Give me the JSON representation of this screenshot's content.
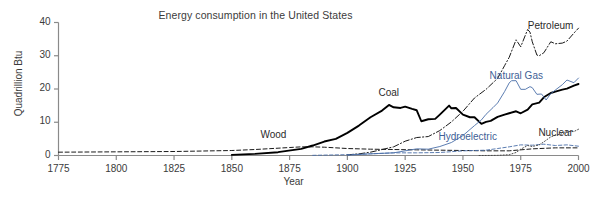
{
  "chart_data": {
    "type": "line",
    "title": "Energy consumption in the United States",
    "xlabel": "Year",
    "ylabel": "Quadrillion Btu",
    "xlim": [
      1775,
      2000
    ],
    "ylim": [
      0,
      40
    ],
    "xticks": [
      "1775",
      "1800",
      "1825",
      "1850",
      "1875",
      "1900",
      "1925",
      "1950",
      "1975",
      "2000"
    ],
    "yticks": [
      "0",
      "10",
      "20",
      "30",
      "40"
    ],
    "grid": false,
    "legend_position": "inline-annotations",
    "series": [
      {
        "name": "Wood",
        "style": "dashed",
        "color": "#1a1a1a",
        "label_x": 1868,
        "label_y": 6.0,
        "x": [
          1775,
          1800,
          1825,
          1850,
          1860,
          1870,
          1875,
          1880,
          1885,
          1890,
          1895,
          1900,
          1910,
          1920,
          1930,
          1940,
          1950,
          1960,
          1970,
          1980,
          1990,
          2000
        ],
        "y": [
          1.0,
          1.1,
          1.2,
          1.5,
          1.8,
          2.2,
          2.4,
          2.6,
          2.6,
          2.5,
          2.3,
          2.1,
          1.9,
          1.8,
          1.7,
          1.6,
          1.5,
          1.4,
          1.4,
          2.0,
          2.3,
          2.3
        ]
      },
      {
        "name": "Coal",
        "style": "solid",
        "color": "#000000",
        "label_x": 1918,
        "label_y": 18.5,
        "x": [
          1850,
          1860,
          1870,
          1880,
          1885,
          1890,
          1895,
          1900,
          1905,
          1910,
          1915,
          1918,
          1920,
          1923,
          1925,
          1928,
          1930,
          1932,
          1935,
          1938,
          1940,
          1944,
          1945,
          1947,
          1950,
          1953,
          1955,
          1958,
          1960,
          1962,
          1965,
          1968,
          1970,
          1973,
          1975,
          1978,
          1980,
          1983,
          1985,
          1988,
          1990,
          1993,
          1995,
          1998,
          2000
        ],
        "y": [
          0.2,
          0.5,
          1.0,
          2.0,
          3.0,
          4.2,
          5.0,
          6.8,
          9.0,
          11.5,
          13.5,
          15.2,
          14.5,
          14.3,
          14.7,
          14.0,
          13.6,
          10.3,
          10.9,
          11.0,
          12.3,
          15.0,
          14.2,
          14.3,
          12.3,
          11.5,
          11.5,
          9.5,
          10.1,
          10.4,
          11.6,
          12.3,
          12.7,
          13.3,
          12.7,
          13.8,
          15.4,
          15.9,
          17.5,
          18.8,
          19.2,
          19.8,
          20.1,
          21.0,
          21.5
        ]
      },
      {
        "name": "Petroleum",
        "style": "dashdot",
        "color": "#1a1a1a",
        "label_x": 1988,
        "label_y": 38.5,
        "x": [
          1900,
          1905,
          1910,
          1915,
          1920,
          1925,
          1930,
          1935,
          1940,
          1945,
          1950,
          1955,
          1960,
          1965,
          1968,
          1970,
          1973,
          1975,
          1978,
          1979,
          1980,
          1982,
          1983,
          1985,
          1988,
          1990,
          1993,
          1995,
          1998,
          2000
        ],
        "y": [
          0.2,
          0.5,
          1.0,
          1.8,
          2.6,
          4.3,
          5.4,
          5.7,
          7.5,
          10.1,
          13.3,
          17.3,
          19.9,
          23.2,
          27.0,
          29.5,
          34.8,
          32.7,
          37.9,
          37.1,
          34.2,
          30.2,
          30.0,
          30.9,
          34.2,
          33.6,
          33.8,
          34.4,
          36.8,
          38.3
        ]
      },
      {
        "name": "Natural Gas",
        "style": "solid-thin",
        "color": "#4a6ea8",
        "label_x": 1973,
        "label_y": 23.5,
        "x": [
          1900,
          1910,
          1920,
          1930,
          1935,
          1940,
          1945,
          1950,
          1955,
          1958,
          1960,
          1963,
          1965,
          1968,
          1970,
          1971,
          1973,
          1975,
          1977,
          1979,
          1980,
          1982,
          1984,
          1986,
          1988,
          1990,
          1993,
          1995,
          1998,
          2000
        ],
        "y": [
          0.1,
          0.5,
          0.8,
          2.0,
          1.9,
          2.7,
          3.9,
          6.0,
          9.0,
          10.7,
          12.4,
          14.4,
          15.8,
          19.2,
          21.8,
          22.5,
          22.5,
          19.9,
          19.9,
          20.7,
          20.4,
          18.4,
          18.5,
          16.7,
          18.6,
          19.7,
          21.3,
          22.7,
          21.9,
          23.3
        ]
      },
      {
        "name": "Hydroelectric",
        "style": "dashed-thin",
        "color": "#4a6ea8",
        "label_x": 1952,
        "label_y": 5.2,
        "x": [
          1885,
          1900,
          1910,
          1920,
          1930,
          1940,
          1950,
          1960,
          1965,
          1970,
          1975,
          1980,
          1985,
          1990,
          1995,
          2000
        ],
        "y": [
          0.05,
          0.25,
          0.5,
          0.8,
          0.8,
          0.9,
          1.4,
          1.6,
          2.1,
          2.6,
          3.2,
          3.1,
          3.4,
          3.0,
          3.2,
          2.8
        ]
      },
      {
        "name": "Nuclear",
        "style": "dotted",
        "color": "#4a4a4a",
        "label_x": 1990,
        "label_y": 6.5,
        "x": [
          1957,
          1960,
          1965,
          1970,
          1973,
          1975,
          1978,
          1980,
          1983,
          1985,
          1988,
          1990,
          1993,
          1995,
          1998,
          2000
        ],
        "y": [
          0.0,
          0.01,
          0.04,
          0.24,
          0.91,
          1.9,
          3.0,
          2.7,
          3.2,
          4.1,
          5.6,
          6.1,
          6.5,
          7.2,
          7.2,
          7.9
        ]
      }
    ]
  }
}
